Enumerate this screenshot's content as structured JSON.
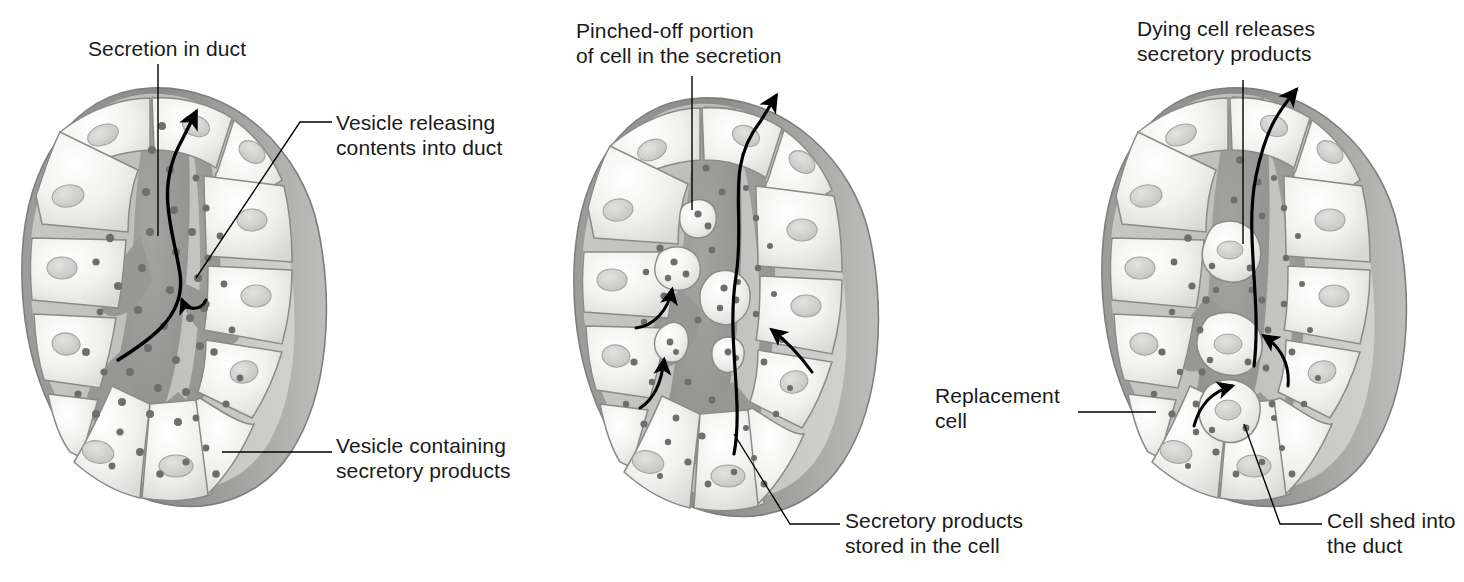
{
  "figure": {
    "background_color": "#ffffff",
    "text_color": "#1a1a1a",
    "line_color": "#000000"
  },
  "palette": {
    "cell_fill": "#f2f2f0",
    "cell_fill_shade": "#dcdcda",
    "cell_outline": "#8a8a88",
    "lumen": "#9b9b99",
    "lumen_dark": "#8f8f8d",
    "granule": "#6d6d6b",
    "nucleus": "#d2d2d0",
    "nucleus_outline": "#a0a09e",
    "capsule": "#8b8b89",
    "capsule_dark": "#7c7c7a",
    "capsule_light": "#c6c6c4"
  },
  "panels": [
    {
      "id": "merocrine",
      "name": "merocrine-gland-panel",
      "labels": [
        {
          "id": "secretion-in-duct",
          "text": "Secretion in duct",
          "x": 88,
          "y": 36,
          "leader": "vertical-down"
        },
        {
          "id": "vesicle-releasing",
          "text": "Vesicle releasing\ncontents into duct",
          "x": 336,
          "y": 110,
          "leader": "elbow-left-down"
        },
        {
          "id": "vesicle-containing",
          "text": "Vesicle containing\nsecretory products",
          "x": 336,
          "y": 433,
          "leader": "horizontal-left"
        }
      ],
      "arrows": [
        {
          "id": "duct-flow-arrow",
          "kind": "long-s-curve-up"
        },
        {
          "id": "vesicle-release-arrow",
          "kind": "short-hook"
        }
      ]
    },
    {
      "id": "apocrine",
      "name": "apocrine-gland-panel",
      "labels": [
        {
          "id": "pinched-off-portion",
          "text": "Pinched-off portion\nof cell in the secretion",
          "x": 576,
          "y": 18,
          "leader": "vertical-down"
        },
        {
          "id": "secretory-products-stored",
          "text": "Secretory products\nstored in the cell",
          "x": 845,
          "y": 508,
          "leader": "diagonal-up-left"
        }
      ],
      "arrows": [
        {
          "id": "duct-flow-arrow",
          "kind": "long-s-curve-up"
        },
        {
          "id": "pinch-arrow-1",
          "kind": "curve-up-right"
        },
        {
          "id": "pinch-arrow-2",
          "kind": "curve-up-right"
        },
        {
          "id": "pinch-arrow-3",
          "kind": "curve-up-left"
        }
      ]
    },
    {
      "id": "holocrine",
      "name": "holocrine-gland-panel",
      "labels": [
        {
          "id": "dying-cell-releases",
          "text": "Dying cell releases\nsecretory products",
          "x": 1137,
          "y": 16,
          "leader": "vertical-down"
        },
        {
          "id": "replacement-cell",
          "text": "Replacement\ncell",
          "x": 935,
          "y": 383,
          "leader": "horizontal-right"
        },
        {
          "id": "cell-shed-into-duct",
          "text": "Cell shed into\nthe duct",
          "x": 1327,
          "y": 508,
          "leader": "diagonal-up-left"
        }
      ],
      "arrows": [
        {
          "id": "duct-flow-arrow",
          "kind": "long-curve-up"
        },
        {
          "id": "shed-arrow-1",
          "kind": "curve-up-right"
        },
        {
          "id": "shed-arrow-2",
          "kind": "curve-up-right"
        }
      ]
    }
  ]
}
